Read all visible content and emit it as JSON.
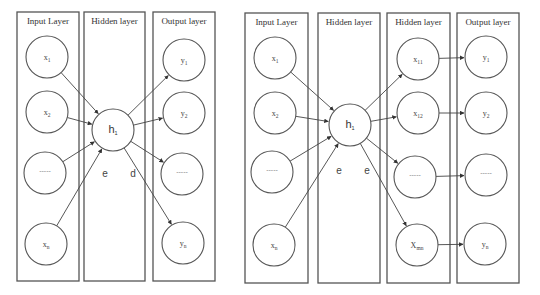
{
  "figure": {
    "left_network": {
      "layers": [
        {
          "id": "input",
          "title": "Input Layer",
          "box": {
            "x": 17,
            "y": 12,
            "w": 62,
            "h": 269
          }
        },
        {
          "id": "hidden",
          "title": "Hidden layer",
          "box": {
            "x": 84,
            "y": 12,
            "w": 61,
            "h": 269
          }
        },
        {
          "id": "output",
          "title": "Output layer",
          "box": {
            "x": 153,
            "y": 12,
            "w": 62,
            "h": 269
          }
        }
      ],
      "nodes": [
        {
          "id": "x1",
          "layer": "input",
          "label": "x",
          "sub": "1",
          "cx": 47,
          "cy": 57,
          "r": 21
        },
        {
          "id": "x2",
          "layer": "input",
          "label": "x",
          "sub": "2",
          "cx": 47,
          "cy": 112,
          "r": 21
        },
        {
          "id": "xdots",
          "layer": "input",
          "label": "-----",
          "sub": "",
          "cx": 45,
          "cy": 173,
          "r": 21
        },
        {
          "id": "xn",
          "layer": "input",
          "label": "x",
          "sub": "n",
          "cx": 46,
          "cy": 244,
          "r": 21
        },
        {
          "id": "h1",
          "layer": "hidden",
          "label": "h",
          "sub": "1",
          "cx": 113,
          "cy": 130,
          "r": 21
        },
        {
          "id": "y1",
          "layer": "output",
          "label": "y",
          "sub": "1",
          "cx": 184,
          "cy": 60,
          "r": 21
        },
        {
          "id": "y2",
          "layer": "output",
          "label": "y",
          "sub": "2",
          "cx": 184,
          "cy": 113,
          "r": 21
        },
        {
          "id": "ydots",
          "layer": "output",
          "label": "-----",
          "sub": "",
          "cx": 182,
          "cy": 174,
          "r": 21
        },
        {
          "id": "yn",
          "layer": "output",
          "label": "y",
          "sub": "n",
          "cx": 183,
          "cy": 243,
          "r": 21
        }
      ],
      "edges": [
        [
          "x1",
          "h1"
        ],
        [
          "x2",
          "h1"
        ],
        [
          "xdots",
          "h1"
        ],
        [
          "xn",
          "h1"
        ],
        [
          "h1",
          "y1"
        ],
        [
          "h1",
          "y2"
        ],
        [
          "h1",
          "ydots"
        ],
        [
          "h1",
          "yn"
        ]
      ],
      "annotations": [
        {
          "text": "e",
          "x": 105,
          "y": 177
        },
        {
          "text": "d",
          "x": 133,
          "y": 177
        }
      ]
    },
    "right_network": {
      "layers": [
        {
          "id": "input",
          "title": "Input Layer",
          "box": {
            "x": 245,
            "y": 13,
            "w": 63,
            "h": 270
          }
        },
        {
          "id": "hidden1",
          "title": "Hidden layer",
          "box": {
            "x": 318,
            "y": 13,
            "w": 62,
            "h": 270
          }
        },
        {
          "id": "hidden2",
          "title": "Hidden layer",
          "box": {
            "x": 387,
            "y": 13,
            "w": 63,
            "h": 270
          }
        },
        {
          "id": "output",
          "title": "Output layer",
          "box": {
            "x": 457,
            "y": 13,
            "w": 62,
            "h": 270
          }
        }
      ],
      "nodes": [
        {
          "id": "x1",
          "layer": "input",
          "label": "x",
          "sub": "1",
          "cx": 275,
          "cy": 58,
          "r": 21
        },
        {
          "id": "x2",
          "layer": "input",
          "label": "x",
          "sub": "2",
          "cx": 275,
          "cy": 113,
          "r": 21
        },
        {
          "id": "xdots",
          "layer": "input",
          "label": "-----",
          "sub": "",
          "cx": 272,
          "cy": 172,
          "r": 21
        },
        {
          "id": "xn",
          "layer": "input",
          "label": "x",
          "sub": "n",
          "cx": 274,
          "cy": 245,
          "r": 21
        },
        {
          "id": "h1",
          "layer": "hidden1",
          "label": "h",
          "sub": "1",
          "cx": 350,
          "cy": 125,
          "r": 21
        },
        {
          "id": "x11",
          "layer": "hidden2",
          "label": "x",
          "sub": "11",
          "cx": 418,
          "cy": 59,
          "r": 21
        },
        {
          "id": "x12",
          "layer": "hidden2",
          "label": "x",
          "sub": "12",
          "cx": 418,
          "cy": 113,
          "r": 21
        },
        {
          "id": "hdots",
          "layer": "hidden2",
          "label": "-----",
          "sub": "",
          "cx": 415,
          "cy": 177,
          "r": 21
        },
        {
          "id": "xmn",
          "layer": "hidden2",
          "label": "X",
          "sub": "mn",
          "cx": 417,
          "cy": 245,
          "r": 21
        },
        {
          "id": "y1",
          "layer": "output",
          "label": "y",
          "sub": "1",
          "cx": 486,
          "cy": 57,
          "r": 21
        },
        {
          "id": "y2",
          "layer": "output",
          "label": "y",
          "sub": "2",
          "cx": 486,
          "cy": 113,
          "r": 21
        },
        {
          "id": "ydots",
          "layer": "output",
          "label": "-----",
          "sub": "",
          "cx": 486,
          "cy": 175,
          "r": 21
        },
        {
          "id": "yn",
          "layer": "output",
          "label": "y",
          "sub": "n",
          "cx": 485,
          "cy": 244,
          "r": 21
        }
      ],
      "edges": [
        [
          "x1",
          "h1"
        ],
        [
          "x2",
          "h1"
        ],
        [
          "xdots",
          "h1"
        ],
        [
          "xn",
          "h1"
        ],
        [
          "h1",
          "x11"
        ],
        [
          "h1",
          "x12"
        ],
        [
          "h1",
          "hdots"
        ],
        [
          "h1",
          "xmn"
        ],
        [
          "x11",
          "y1"
        ],
        [
          "x12",
          "y2"
        ],
        [
          "hdots",
          "ydots"
        ],
        [
          "xmn",
          "yn"
        ]
      ],
      "annotations": [
        {
          "text": "e",
          "x": 339,
          "y": 174
        },
        {
          "text": "e",
          "x": 367,
          "y": 174
        }
      ]
    },
    "colors": {
      "stroke": "#555555",
      "edge": "#444444",
      "text": "#333333",
      "background": "#ffffff"
    }
  }
}
